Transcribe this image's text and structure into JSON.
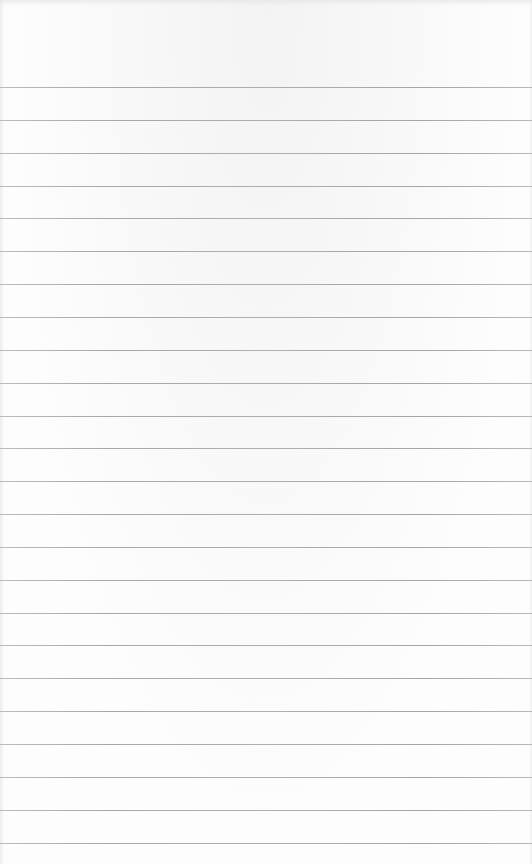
{
  "page": {
    "type": "lined-paper",
    "background_color": "#fdfdfd",
    "line_color": "#a6a6a6",
    "line_count": 24,
    "first_line_y": 87,
    "line_spacing": 32.85,
    "text": ""
  }
}
